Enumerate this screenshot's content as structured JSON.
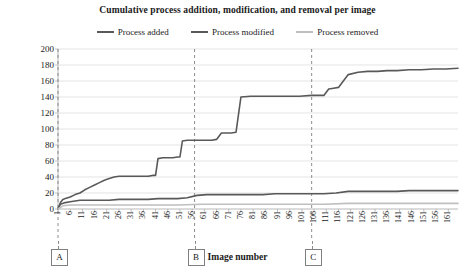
{
  "chart_data": {
    "type": "line",
    "title": "Cumulative process addition,  modification, and removal per image",
    "xlabel": "Image number",
    "ylabel": "Number",
    "ylim": [
      0,
      200
    ],
    "xlim": [
      1,
      165
    ],
    "y_ticks": [
      0,
      20,
      40,
      60,
      80,
      100,
      120,
      140,
      160,
      180,
      200
    ],
    "x_ticks": [
      1,
      6,
      11,
      16,
      21,
      26,
      31,
      36,
      41,
      46,
      51,
      56,
      61,
      66,
      71,
      76,
      81,
      86,
      91,
      96,
      101,
      106,
      111,
      116,
      121,
      126,
      131,
      136,
      141,
      146,
      151,
      156,
      161
    ],
    "grid": "horizontal",
    "legend_position": "top-center",
    "colors": {
      "process_added": "#595959",
      "process_modified": "#595959",
      "process_removed": "#bfbfbf",
      "gridline": "#d9d9d9",
      "marker_line": "#8c8c8c"
    },
    "series": [
      {
        "name": "Process added",
        "color": "#595959",
        "points": [
          [
            1,
            0
          ],
          [
            2,
            8
          ],
          [
            3,
            12
          ],
          [
            4,
            13
          ],
          [
            5,
            14
          ],
          [
            6,
            15
          ],
          [
            8,
            18
          ],
          [
            10,
            20
          ],
          [
            12,
            24
          ],
          [
            14,
            27
          ],
          [
            16,
            30
          ],
          [
            18,
            33
          ],
          [
            20,
            36
          ],
          [
            22,
            38
          ],
          [
            24,
            40
          ],
          [
            26,
            41
          ],
          [
            28,
            41
          ],
          [
            30,
            41
          ],
          [
            32,
            41
          ],
          [
            34,
            41
          ],
          [
            36,
            41
          ],
          [
            38,
            41
          ],
          [
            40,
            42
          ],
          [
            41,
            42
          ],
          [
            42,
            63
          ],
          [
            44,
            64
          ],
          [
            46,
            64
          ],
          [
            48,
            64
          ],
          [
            50,
            65
          ],
          [
            51,
            65
          ],
          [
            52,
            85
          ],
          [
            54,
            86
          ],
          [
            56,
            86
          ],
          [
            58,
            86
          ],
          [
            60,
            86
          ],
          [
            62,
            86
          ],
          [
            64,
            86
          ],
          [
            66,
            87
          ],
          [
            68,
            95
          ],
          [
            70,
            95
          ],
          [
            72,
            95
          ],
          [
            74,
            96
          ],
          [
            76,
            140
          ],
          [
            80,
            141
          ],
          [
            85,
            141
          ],
          [
            90,
            141
          ],
          [
            95,
            141
          ],
          [
            100,
            141
          ],
          [
            105,
            142
          ],
          [
            110,
            142
          ],
          [
            112,
            150
          ],
          [
            114,
            151
          ],
          [
            116,
            152
          ],
          [
            118,
            160
          ],
          [
            120,
            168
          ],
          [
            124,
            171
          ],
          [
            128,
            172
          ],
          [
            132,
            172
          ],
          [
            136,
            173
          ],
          [
            140,
            173
          ],
          [
            145,
            174
          ],
          [
            150,
            174
          ],
          [
            155,
            175
          ],
          [
            160,
            175
          ],
          [
            165,
            176
          ]
        ]
      },
      {
        "name": "Process modified",
        "color": "#595959",
        "points": [
          [
            1,
            0
          ],
          [
            2,
            6
          ],
          [
            4,
            8
          ],
          [
            6,
            9
          ],
          [
            8,
            10
          ],
          [
            10,
            11
          ],
          [
            14,
            11
          ],
          [
            18,
            11
          ],
          [
            22,
            11
          ],
          [
            26,
            12
          ],
          [
            30,
            12
          ],
          [
            34,
            12
          ],
          [
            38,
            12
          ],
          [
            42,
            13
          ],
          [
            46,
            13
          ],
          [
            50,
            13
          ],
          [
            54,
            14
          ],
          [
            58,
            17
          ],
          [
            62,
            18
          ],
          [
            66,
            18
          ],
          [
            70,
            18
          ],
          [
            75,
            18
          ],
          [
            80,
            18
          ],
          [
            85,
            18
          ],
          [
            90,
            19
          ],
          [
            95,
            19
          ],
          [
            100,
            19
          ],
          [
            105,
            19
          ],
          [
            110,
            19
          ],
          [
            115,
            20
          ],
          [
            120,
            22
          ],
          [
            125,
            22
          ],
          [
            130,
            22
          ],
          [
            135,
            22
          ],
          [
            140,
            22
          ],
          [
            145,
            23
          ],
          [
            150,
            23
          ],
          [
            155,
            23
          ],
          [
            160,
            23
          ],
          [
            165,
            23
          ]
        ]
      },
      {
        "name": "Process removed",
        "color": "#bfbfbf",
        "points": [
          [
            1,
            0
          ],
          [
            3,
            4
          ],
          [
            6,
            5
          ],
          [
            10,
            5
          ],
          [
            20,
            5
          ],
          [
            30,
            5
          ],
          [
            40,
            5
          ],
          [
            50,
            5
          ],
          [
            60,
            6
          ],
          [
            70,
            6
          ],
          [
            80,
            6
          ],
          [
            90,
            6
          ],
          [
            100,
            6
          ],
          [
            110,
            6
          ],
          [
            120,
            7
          ],
          [
            130,
            7
          ],
          [
            140,
            7
          ],
          [
            150,
            7
          ],
          [
            160,
            7
          ],
          [
            165,
            7
          ]
        ]
      }
    ],
    "markers": [
      {
        "label": "A",
        "x": 1
      },
      {
        "label": "B",
        "x": 57
      },
      {
        "label": "C",
        "x": 105
      }
    ]
  }
}
